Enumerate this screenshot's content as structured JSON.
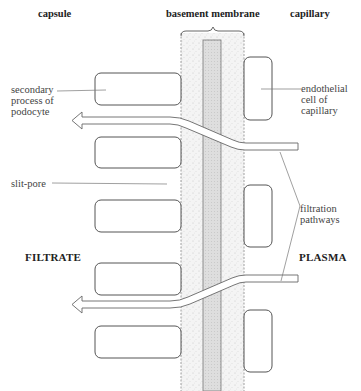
{
  "headers": {
    "capsule": "capsule",
    "basement_membrane": "basement membrane",
    "capillary": "capillary"
  },
  "labels": {
    "secondary_process": "secondary\nprocess of\npodocyte",
    "endothelial_cell": "endothelial\ncell of\ncapillary",
    "slit_pore": "slit-pore",
    "filtration_pathways": "filtration\npathways",
    "filtrate": "FILTRATE",
    "plasma": "PLASMA"
  },
  "colors": {
    "outline": "#555555",
    "membrane_fill": "#f3f3f3",
    "lamina_fill": "#dcdcdc"
  },
  "structures": {
    "podocyte_processes": 5,
    "endothelial_cells": 3,
    "filtration_arrows": 2
  }
}
